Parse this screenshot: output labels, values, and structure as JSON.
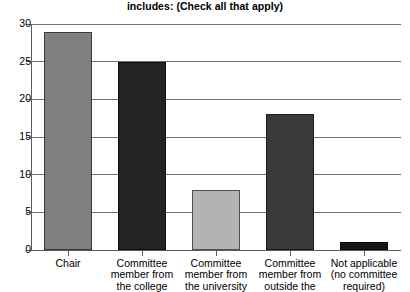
{
  "chart_data": {
    "type": "bar",
    "title": "includes: (Check all that apply)",
    "xlabel": "",
    "ylabel": "",
    "ylim": [
      0,
      30
    ],
    "yticks": [
      0,
      5,
      10,
      15,
      20,
      25,
      30
    ],
    "grid": true,
    "legend": "none",
    "categories": [
      "Chair",
      "Committee member from the college",
      "Committee member from the university",
      "Committee member from outside the",
      "Not applicable (no committee required)"
    ],
    "category_lines": [
      [
        "Chair"
      ],
      [
        "Committee",
        "member from",
        "the college"
      ],
      [
        "Committee",
        "member from",
        "the university"
      ],
      [
        "Committee",
        "member from",
        "outside the"
      ],
      [
        "Not applicable",
        "(no committee",
        "required)"
      ]
    ],
    "values": [
      29,
      25,
      8,
      18,
      1
    ],
    "bar_colors": [
      "#808080",
      "#232323",
      "#b3b3b3",
      "#3a3a3a",
      "#161616"
    ]
  },
  "axis": {
    "y_tick_labels": [
      "0",
      "5",
      "10",
      "15",
      "20",
      "25",
      "30"
    ]
  }
}
